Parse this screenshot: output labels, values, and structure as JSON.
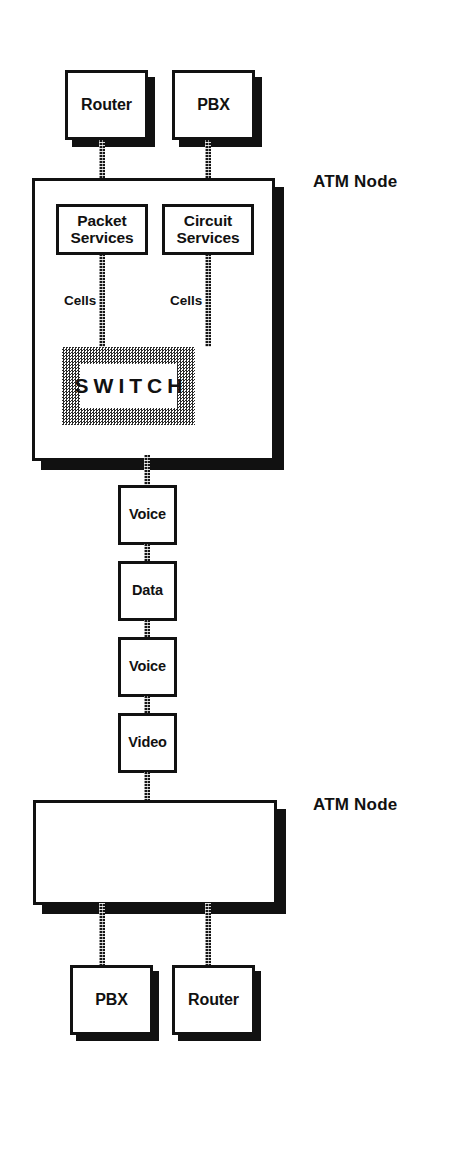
{
  "diagram": {
    "colors": {
      "line": "#111111",
      "fill": "#ffffff",
      "shadow": "#111111",
      "switch_pattern": "#2a2a2a"
    },
    "top_endpoints": [
      {
        "label": "Router"
      },
      {
        "label": "PBX"
      }
    ],
    "top_node": {
      "caption": "ATM Node",
      "services": [
        {
          "label": "Packet\nServices",
          "line1": "Packet",
          "line2": "Services"
        },
        {
          "label": "Circuit\nServices",
          "line1": "Circuit",
          "line2": "Services"
        }
      ],
      "cell_labels": [
        "Cells",
        "Cells"
      ],
      "switch": {
        "label": "SWITCH"
      }
    },
    "trunk_stream": [
      {
        "label": "Voice"
      },
      {
        "label": "Data"
      },
      {
        "label": "Voice"
      },
      {
        "label": "Video"
      }
    ],
    "bottom_node": {
      "caption": "ATM Node"
    },
    "bottom_endpoints": [
      {
        "label": "PBX"
      },
      {
        "label": "Router"
      }
    ]
  }
}
